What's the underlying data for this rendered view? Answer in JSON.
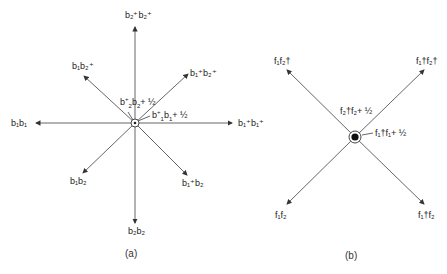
{
  "panel_a": {
    "caption": "(a)",
    "center_label_upper": {
      "op": "b",
      "sup1": "+",
      "sub1": "2",
      "op2": "b",
      "sub2": "2",
      "rest": "+ ½"
    },
    "center_label_lower": {
      "op": "b",
      "sup1": "+",
      "sub1": "1",
      "op2": "b",
      "sub2": "1",
      "rest": "+ ½"
    },
    "arrows": [
      {
        "dir": "up",
        "label": "b₂⁺b₂⁺"
      },
      {
        "dir": "up-left",
        "label": "b₁b₂⁺"
      },
      {
        "dir": "up-right",
        "label": "b₁⁺b₂⁺"
      },
      {
        "dir": "left",
        "label": "b₁b₁"
      },
      {
        "dir": "right",
        "label": "b₁⁺b₁⁺"
      },
      {
        "dir": "down-left",
        "label": "b₁b₂"
      },
      {
        "dir": "down-right",
        "label": "b₁⁺b₂"
      },
      {
        "dir": "down",
        "label": "b₂b₂"
      }
    ]
  },
  "panel_b": {
    "caption": "(b)",
    "center_label_upper": "f₂†f₂+ ½",
    "center_label_lower": "f₁†f₁+ ½",
    "arrows": [
      {
        "dir": "up-left",
        "label": "f₁f₂†"
      },
      {
        "dir": "up-right",
        "label": "f₁†f₂†"
      },
      {
        "dir": "down-left",
        "label": "f₁f₂"
      },
      {
        "dir": "down-right",
        "label": "f₁†f₂"
      }
    ]
  }
}
